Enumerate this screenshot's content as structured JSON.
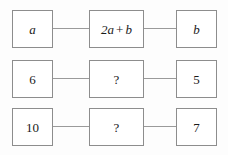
{
  "diagram": {
    "type": "function-machine-grid",
    "columns": 3,
    "rows": [
      {
        "id": "row-variables",
        "left": "a",
        "middle": "2a + b",
        "middle_parts": {
          "coefficient_term": "2a",
          "operator": "+",
          "second_term": "b"
        },
        "right": "b",
        "style": "italic-variables"
      },
      {
        "id": "row-first-values",
        "left": "6",
        "middle": "?",
        "right": "5",
        "style": "numeric"
      },
      {
        "id": "row-second-values",
        "left": "10",
        "middle": "?",
        "right": "7",
        "style": "numeric"
      }
    ]
  },
  "colors": {
    "box_border": "#8d8d8d",
    "connector": "#9a9a9a",
    "text": "#1a1a1a",
    "background": "#fdfdfd",
    "box_fill": "#ffffff"
  }
}
